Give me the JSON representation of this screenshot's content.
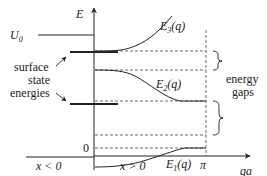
{
  "diagram": {
    "axes": {
      "vertical_label": "E",
      "horizontal_label": "qa",
      "origin_label": "0",
      "pi_label": "π"
    },
    "regions": {
      "left": "x < 0",
      "right": "x > 0"
    },
    "potential": {
      "label_main": "U",
      "label_sub": "0"
    },
    "bands": [
      {
        "name": "E",
        "sub": "3",
        "arg": "(q)"
      },
      {
        "name": "E",
        "sub": "2",
        "arg": "(q)"
      },
      {
        "name": "E",
        "sub": "1",
        "arg": "(q)"
      }
    ],
    "annotations": {
      "surface_states": [
        "surface",
        "state",
        "energies"
      ],
      "gaps": [
        "energy",
        "gaps"
      ]
    },
    "colors": {
      "line": "#222222",
      "dashed": "#444444",
      "background": "#ffffff"
    }
  }
}
